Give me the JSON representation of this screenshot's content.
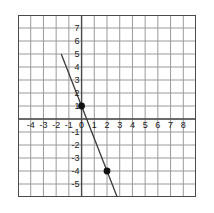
{
  "chart_data": {
    "type": "line",
    "title": "",
    "xlabel": "",
    "ylabel": "",
    "xlim": [
      -5,
      9
    ],
    "ylim": [
      -6,
      8
    ],
    "grid": true,
    "legend": "none",
    "x_tick_labels": [
      "-4",
      "-3",
      "-2",
      "-1",
      "0",
      "1",
      "2",
      "3",
      "4",
      "5",
      "6",
      "7",
      "8"
    ],
    "x_tick_values": [
      -4,
      -3,
      -2,
      -1,
      0,
      1,
      2,
      3,
      4,
      5,
      6,
      7,
      8
    ],
    "y_tick_labels": [
      "7",
      "6",
      "5",
      "4",
      "3",
      "2",
      "1",
      "-1",
      "-2",
      "-3",
      "-4",
      "-5"
    ],
    "y_tick_values": [
      7,
      6,
      5,
      4,
      3,
      2,
      1,
      -1,
      -2,
      -3,
      -4,
      -5
    ],
    "series": [
      {
        "name": "line",
        "slope": -2.5,
        "intercept": 1,
        "x": [
          -1.6,
          3.0
        ],
        "y": [
          5.0,
          -6.5
        ],
        "color": "#3a3a3a"
      }
    ],
    "points": [
      {
        "label": "(0, 1)",
        "x": 0,
        "y": 1
      },
      {
        "label": "(2, -4)",
        "x": 2,
        "y": -4
      }
    ],
    "colors": {
      "grid": "#9a9a9a",
      "axis": "#4a4a4a",
      "line": "#3a3a3a",
      "point": "#111111",
      "background": "#ffffff",
      "text": "#1a1a1a"
    }
  }
}
